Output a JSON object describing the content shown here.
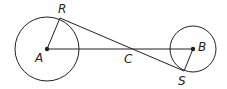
{
  "diagram": {
    "type": "geometry",
    "colors": {
      "stroke": "#231f20",
      "background": "#ffffff"
    },
    "circles": [
      {
        "name": "A",
        "cx": 47,
        "cy": 49,
        "r": 32
      },
      {
        "name": "B",
        "cx": 193,
        "cy": 49,
        "r": 23
      }
    ],
    "points": {
      "A": {
        "x": 47,
        "y": 49,
        "label": "A"
      },
      "B": {
        "x": 193,
        "y": 49,
        "label": "B"
      },
      "C": {
        "x": 130,
        "y": 49,
        "label": "C"
      },
      "R": {
        "x": 60,
        "y": 18,
        "label": "R"
      },
      "S": {
        "x": 184,
        "y": 71,
        "label": "S"
      }
    },
    "segments": [
      [
        "A",
        "B"
      ],
      [
        "A",
        "R"
      ],
      [
        "B",
        "S"
      ],
      [
        "R",
        "S"
      ]
    ]
  }
}
